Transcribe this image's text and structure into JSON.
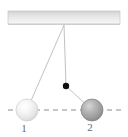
{
  "figure": {
    "type": "pendulum-collision-diagram",
    "width": 128,
    "height": 137,
    "background_color": "#ffffff"
  },
  "ceiling": {
    "name": "support-bar",
    "x": 8,
    "y": 11,
    "width": 112,
    "height": 13,
    "fill_top_color": "#d3d3d3",
    "fill_bottom_color": "#f4f4f4",
    "edge_color": "#c9c9c9"
  },
  "pivot": {
    "name": "pivot-point",
    "x": 64,
    "y": 25
  },
  "strings": [
    {
      "name": "string-to-ball-1",
      "x1": 64,
      "y1": 25,
      "x2": 27,
      "y2": 110,
      "color": "#c2c2c2",
      "width": 1
    },
    {
      "name": "vertical-string",
      "x1": 64,
      "y1": 25,
      "x2": 66,
      "y2": 86,
      "color": "#c2c2c2",
      "width": 1
    },
    {
      "name": "string-to-ball-2",
      "x1": 66,
      "y1": 86,
      "x2": 92,
      "y2": 110,
      "color": "#c2c2c2",
      "width": 1
    }
  ],
  "marker": {
    "name": "bob-marker-dot",
    "x": 66,
    "y": 86,
    "radius": 3.2,
    "color": "#101010"
  },
  "axis_line": {
    "name": "horizontal-dashed-axis",
    "x1": 8,
    "x2": 122,
    "y": 110,
    "color": "#8c8c8c",
    "dash": "5 4",
    "width": 1.2
  },
  "balls": [
    {
      "name": "ball-1",
      "label": "1",
      "cx": 27,
      "cy": 110,
      "r": 11,
      "highlight_color": "#fdfdfd",
      "mid_color": "#ededed",
      "edge_color": "#d0d0d0",
      "label_x": 24,
      "label_y": 132
    },
    {
      "name": "ball-2",
      "label": "2",
      "cx": 92,
      "cy": 110,
      "r": 11,
      "highlight_color": "#c9c9c9",
      "mid_color": "#a2a2a2",
      "edge_color": "#8a8a8a",
      "label_x": 90,
      "label_y": 131
    }
  ]
}
